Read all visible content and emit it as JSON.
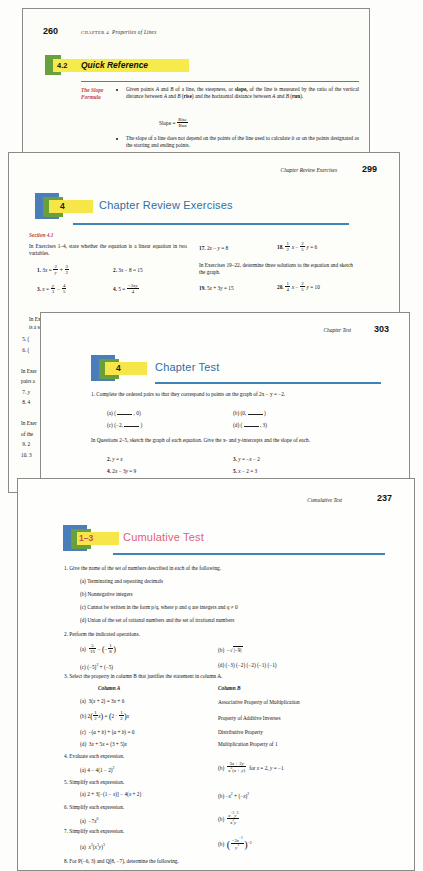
{
  "document": {
    "kind": "scanned-textbook-pages-composite",
    "sheet_count": 4
  },
  "page_quick_reference": {
    "folio": "260",
    "running_head_chapter": "CHAPTER 4",
    "running_head_title": "Properties of Lines",
    "section_number": "4.2",
    "section_title": "Quick Reference",
    "margin_label_line1": "The Slope",
    "margin_label_line2": "Formula",
    "bullet_1": "Given points A and B of a line, the steepness, or slope, of the line is measured by the ratio of the vertical distance between A and B (rise) and the horizontal distance between A and B (run).",
    "formula_label": "Slope =",
    "formula_numerator": "Rise",
    "formula_denominator": "Run",
    "bullet_2": "The slope of a line does not depend on the points of the line used to calculate it or on the points designated as the starting and ending points.",
    "bullet_3_clipped": "For two points (x₁, y₁) and (x₂, y₂) of a line m, then the slope m is defined as"
  },
  "page_chapter_review": {
    "folio": "299",
    "running_head": "Chapter Review Exercises",
    "chapter_number": "4",
    "title": "Chapter Review Exercises",
    "section_label": "Section 4.1",
    "intro_1": "In Exercises 1–4, state whether the equation is a linear equation in two variables.",
    "left_items": [
      {
        "n": "1.",
        "expr": "3x = 2/y + 3/2"
      },
      {
        "n": "2.",
        "expr": "3x − 8 = 15"
      },
      {
        "n": "3.",
        "expr": "x = y/3 − 4/5"
      },
      {
        "n": "4.",
        "expr": "5 = −3xy/4"
      }
    ],
    "right_items_top": [
      {
        "n": "17.",
        "expr": "2x − y = 8"
      },
      {
        "n": "18.",
        "expr": "1/2 x − 2/5 y = 6"
      }
    ],
    "intro_2": "In Exercises 19–22, determine three solutions to the equation and sketch the graph.",
    "right_items_bottom": [
      {
        "n": "19.",
        "expr": "5x + 3y = 15"
      },
      {
        "n": "20.",
        "expr": "1/4 x − 2/5 y = 10"
      }
    ],
    "clipped_left_column": [
      "In Exer",
      "is a sol",
      "5. (",
      "6. (",
      "In Exer",
      "pairs a",
      "7. y",
      "8. 4",
      "In Exer",
      "of the",
      "9. 2",
      "10. 3"
    ]
  },
  "page_chapter_test": {
    "folio": "303",
    "running_head": "Chapter Test",
    "chapter_number": "4",
    "title": "Chapter Test",
    "q1_text": "1. Complete the ordered pairs so that they correspond to points on the graph of 2x − y = −2.",
    "q1_parts": [
      {
        "label": "(a)",
        "expr": "( ____ , 0)"
      },
      {
        "label": "(b)",
        "expr": "(0, ____ )"
      },
      {
        "label": "(c)",
        "expr": "(−2, ____ )"
      },
      {
        "label": "(d)",
        "expr": "( ____ , 3)"
      }
    ],
    "q2_intro": "In Questions 2–5, sketch the graph of each equation. Give the x- and y-intercepts and the slope of each.",
    "q_items": [
      {
        "n": "2.",
        "expr": "y = x"
      },
      {
        "n": "3.",
        "expr": "y = −x − 2"
      },
      {
        "n": "4.",
        "expr": "2x − 3y = 9"
      },
      {
        "n": "5.",
        "expr": "x − 2 = 3"
      }
    ]
  },
  "page_cumulative_test": {
    "folio": "237",
    "running_head": "Cumulative Test",
    "chapter_number": "1–3",
    "title": "Cumulative Test",
    "q1": {
      "text": "1. Give the name of the set of numbers described in each of the following.",
      "parts": [
        {
          "label": "(a)",
          "text": "Terminating and repeating decimals"
        },
        {
          "label": "(b)",
          "text": "Nonnegative integers"
        },
        {
          "label": "(c)",
          "text": "Cannot be written in the form p/q, where p and q are integers and q ≠ 0"
        },
        {
          "label": "(d)",
          "text": "Union of the set of rational numbers and the set of irrational numbers"
        }
      ]
    },
    "q2": {
      "text": "2. Perform the indicated operations.",
      "a": "5/16 − ( − 1/8 )",
      "b": "−√|−9|",
      "c": "(−5)² + (−5)",
      "d": "(−3) (−2) (−2) (−1) (−1)"
    },
    "q3": {
      "text": "3. Select the property in column B that justifies the statement in column A.",
      "col_a_header": "Column A",
      "col_b_header": "Column B",
      "rows": [
        {
          "a_label": "(a)",
          "a": "3(x + 2) = 3x + 6",
          "b": "Associative Property of Multiplication"
        },
        {
          "a_label": "(b)",
          "a": "2( 1/2 x ) = ( 2 · 1/2 )x",
          "b": "Property of Additive Inverses"
        },
        {
          "a_label": "(c)",
          "a": "−(a + b) + (a + b) = 0",
          "b": "Distributive Property"
        },
        {
          "a_label": "(d)",
          "a": "3x + 5x = (3 + 5)x",
          "b": "Multiplication Property of 1"
        }
      ]
    },
    "q4": {
      "text": "4. Evaluate each expression.",
      "a": "4 − 4(1 − 2)²",
      "b": "(3x + 2y)/(x²(x + y)) for x = 2, y = −1"
    },
    "q5": {
      "text": "5. Simplify each expression.",
      "a": "2 + 3[−(1 − x)] − 4(x + 2)",
      "b": "−x² + (−x)²"
    },
    "q6": {
      "text": "6. Simplify each expression.",
      "a": "−7x⁰",
      "b": "(x⁻⁵y³)/(x³y)"
    },
    "q7": {
      "text": "7. Simplify each expression.",
      "a": "x²(x³y)³",
      "b": "((−2x⁻¹)/y²)⁻²"
    },
    "q8": {
      "text": "8. For P(−6, 3) and Q(8, −7), determine the following."
    }
  },
  "colors": {
    "head_blue": "#4a7ebb",
    "head_green": "#6aa03c",
    "highlight_yellow": "#f7e64a",
    "title_blue": "#2e6ea6",
    "title_red": "#e0607e",
    "rule_blue": "#3f83b8",
    "section_label_red": "#c23b4a",
    "paper": "#fbfbf7"
  }
}
